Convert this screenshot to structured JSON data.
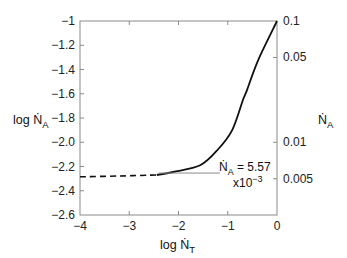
{
  "chart_data": {
    "type": "line",
    "title": "",
    "xlabel": {
      "prefix": "log ",
      "symbol": "Ṅ",
      "subscript": "T"
    },
    "ylabel_left": {
      "prefix": "log ",
      "symbol": "Ṅ",
      "subscript": "A"
    },
    "ylabel_right": {
      "prefix": "",
      "symbol": "Ṅ",
      "subscript": "A"
    },
    "xlim": [
      -4,
      0
    ],
    "ylim": [
      -2.6,
      -1
    ],
    "x_ticks": [
      -4,
      -3,
      -2,
      -1,
      0
    ],
    "x_tick_labels": [
      "−4",
      "−3",
      "−2",
      "−1",
      "0"
    ],
    "y_ticks_left": [
      -1,
      -1.2,
      -1.4,
      -1.6,
      -1.8,
      -2.0,
      -2.2,
      -2.4,
      -2.6
    ],
    "y_tick_labels_left": [
      "−1",
      "−1.2",
      "−1.4",
      "−1.6",
      "−1.8",
      "−2.0",
      "−2.2",
      "−2.4",
      "−2.6"
    ],
    "y_ticks_right_values": [
      0.1,
      0.05,
      0.01,
      0.005
    ],
    "y_tick_labels_right": [
      "0.1",
      "0.05",
      "0.01",
      "0.005"
    ],
    "grid": false,
    "series": [
      {
        "name": "measured/model (solid)",
        "style": "solid",
        "x": [
          -2.44,
          -2.11,
          -1.56,
          -1.2,
          -0.91,
          -0.69,
          -0.61,
          -0.38,
          0.0
        ],
        "y": [
          -2.27,
          -2.245,
          -2.19,
          -2.06,
          -1.9,
          -1.65,
          -1.57,
          -1.32,
          -1.0
        ]
      },
      {
        "name": "extrapolation (dashed)",
        "style": "dashed",
        "x": [
          -4.0,
          -3.2,
          -2.44
        ],
        "y": [
          -2.285,
          -2.278,
          -2.27
        ]
      }
    ],
    "annotations": [
      {
        "type": "hline",
        "y": -2.254,
        "x_from": -2.4,
        "x_to": -1.2,
        "line1": {
          "symbol": "Ṅ",
          "subscript": "A",
          "text": " = 5.57"
        },
        "line2": {
          "text": "x10",
          "superscript": "−3"
        }
      }
    ]
  }
}
